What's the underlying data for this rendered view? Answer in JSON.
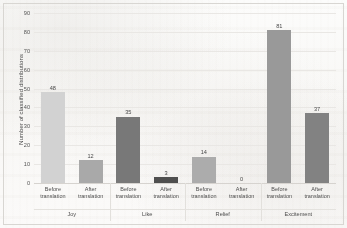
{
  "chart_data": {
    "type": "bar",
    "title": "",
    "subtitle": "",
    "xlabel": "",
    "ylabel": "Number of classified distributions",
    "ylim": [
      0,
      90
    ],
    "yticks": [
      0,
      10,
      20,
      30,
      40,
      50,
      60,
      70,
      80,
      90
    ],
    "grid": true,
    "legend": "none",
    "categories": [
      "Joy",
      "Like",
      "Relief",
      "Excitement"
    ],
    "subcategories": [
      "Before translation",
      "After translation"
    ],
    "series": [
      {
        "name": "Before translation",
        "values": [
          48,
          35,
          14,
          81
        ]
      },
      {
        "name": "After translation",
        "values": [
          12,
          3,
          0,
          37
        ]
      }
    ],
    "groups": [
      {
        "label": "Joy",
        "bars": [
          {
            "sub_line1": "Before",
            "sub_line2": "translation",
            "value": 48,
            "label": "48",
            "color": "#d2d2d2"
          },
          {
            "sub_line1": "After",
            "sub_line2": "translation",
            "value": 12,
            "label": "12",
            "color": "#a9a9a9"
          }
        ]
      },
      {
        "label": "Like",
        "bars": [
          {
            "sub_line1": "Before",
            "sub_line2": "translation",
            "value": 35,
            "label": "35",
            "color": "#787878"
          },
          {
            "sub_line1": "After",
            "sub_line2": "translation",
            "value": 3,
            "label": "3",
            "color": "#4f4f4f"
          }
        ]
      },
      {
        "label": "Relief",
        "bars": [
          {
            "sub_line1": "Before",
            "sub_line2": "translation",
            "value": 14,
            "label": "14",
            "color": "#acacac"
          },
          {
            "sub_line1": "After",
            "sub_line2": "translation",
            "value": 0,
            "label": "0",
            "color": "#9e9e9e"
          }
        ]
      },
      {
        "label": "Excitement",
        "bars": [
          {
            "sub_line1": "Before",
            "sub_line2": "translation",
            "value": 81,
            "label": "81",
            "color": "#999999"
          },
          {
            "sub_line1": "After",
            "sub_line2": "translation",
            "value": 37,
            "label": "37",
            "color": "#828282"
          }
        ]
      }
    ],
    "colors": {
      "gridline": "#e9e7e4",
      "frame": "#d8d6d2",
      "text": "#4a4a4a",
      "background": "#fbfbfa"
    }
  }
}
